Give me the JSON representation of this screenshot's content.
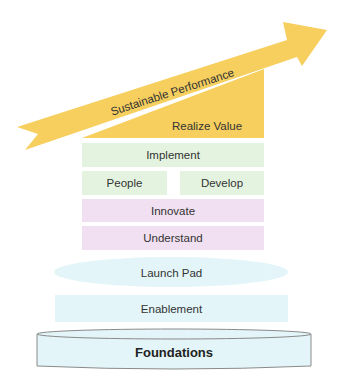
{
  "diagram": {
    "arrow": {
      "label": "Sustainable Performance",
      "color": "#F6CF5E"
    },
    "triangle": {
      "label": "Realize Value",
      "color": "#F6CF5E"
    },
    "layers": {
      "implement": {
        "label": "Implement",
        "color": "#E4F3E0"
      },
      "people": {
        "label": "People",
        "color": "#E4F3E0"
      },
      "develop": {
        "label": "Develop",
        "color": "#E4F3E0"
      },
      "innovate": {
        "label": "Innovate",
        "color": "#F1E0F1"
      },
      "understand": {
        "label": "Understand",
        "color": "#F1E0F1"
      },
      "launch_pad": {
        "label": "Launch Pad",
        "color": "#E3F5F8"
      },
      "enablement": {
        "label": "Enablement",
        "color": "#E3F5F8"
      },
      "foundations": {
        "label": "Foundations",
        "color": "#E3F5F8"
      }
    }
  }
}
